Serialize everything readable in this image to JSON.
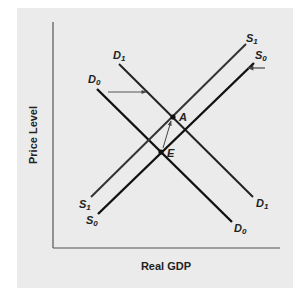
{
  "diagram": {
    "type": "AD-AS shift diagram",
    "background_color": "#ebebeb",
    "line_color": "#111111",
    "axis_color": "#555555",
    "x_axis_label": "Real GDP",
    "y_axis_label": "Price Level",
    "curves": [
      {
        "id": "D0",
        "base": "D",
        "sub": "0",
        "role": "initial aggregate demand"
      },
      {
        "id": "D1",
        "base": "D",
        "sub": "1",
        "role": "shifted aggregate demand"
      },
      {
        "id": "S0",
        "base": "S",
        "sub": "0",
        "role": "initial aggregate supply"
      },
      {
        "id": "S1",
        "base": "S",
        "sub": "1",
        "role": "shifted aggregate supply"
      }
    ],
    "points": [
      {
        "label": "E",
        "meaning": "initial equilibrium (D0 ∩ S0)"
      },
      {
        "label": "A",
        "meaning": "new equilibrium (D1 ∩ S1)"
      }
    ],
    "arrows": [
      {
        "meaning": "demand shifts right from D0 to D1"
      },
      {
        "meaning": "supply shifts left from S0 to S1"
      },
      {
        "meaning": "equilibrium moves from E to A"
      }
    ]
  },
  "labels": {
    "D": "D",
    "S": "S",
    "sub0": "0",
    "sub1": "1",
    "A": "A",
    "E": "E"
  }
}
